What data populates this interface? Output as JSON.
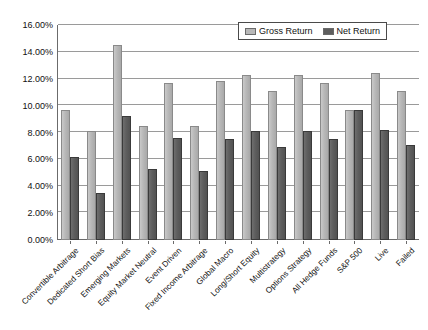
{
  "chart_data": {
    "type": "bar",
    "title": "",
    "xlabel": "",
    "ylabel": "",
    "ylim": [
      0,
      16
    ],
    "ytick_labels": [
      "0.00%",
      "2.00%",
      "4.00%",
      "6.00%",
      "8.00%",
      "10.00%",
      "12.00%",
      "14.00%",
      "16.00%"
    ],
    "ytick_values": [
      0,
      2,
      4,
      6,
      8,
      10,
      12,
      14,
      16
    ],
    "grid": true,
    "legend_position": "top-right",
    "categories": [
      "Convertible Arbitrage",
      "Dedicated Short Bias",
      "Emerging Markets",
      "Equity Market Neutral",
      "Event Driven",
      "Fixed Income Arbitrage",
      "Global Macro",
      "Long/Short Equity",
      "Multistrategy",
      "Options Strategy",
      "All Hedge Funds",
      "S&P 500",
      "Live",
      "Failed"
    ],
    "series": [
      {
        "name": "Gross Return",
        "color": "#b8b8b8",
        "values": [
          9.7,
          8.1,
          14.5,
          8.5,
          11.7,
          8.5,
          11.8,
          12.3,
          11.1,
          12.3,
          11.7,
          9.7,
          12.4,
          11.1
        ]
      },
      {
        "name": "Net Return",
        "color": "#5e5e5e",
        "values": [
          6.2,
          3.5,
          9.2,
          5.3,
          7.6,
          5.1,
          7.5,
          8.1,
          6.9,
          8.1,
          7.5,
          9.7,
          8.2,
          7.1
        ]
      }
    ]
  }
}
